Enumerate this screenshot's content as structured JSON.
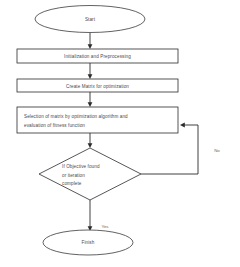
{
  "diagram": {
    "background_color": "#ffffff",
    "line_color": "#2b2b2b",
    "text_color": "#4a4a4a",
    "nodes": {
      "start": {
        "label": "Start",
        "shape": "ellipse"
      },
      "initialization": {
        "label": "Initialization and Preprocessing",
        "shape": "process"
      },
      "create_matrix": {
        "label": "Create Matrix for optimization",
        "shape": "process"
      },
      "selection": {
        "line1": "Selection of matrix by optimization algorithm and",
        "line2": "evaluation of fitness function",
        "shape": "process"
      },
      "decision": {
        "line1": "If Objective found",
        "line2": "or iteration",
        "line3": "complete",
        "shape": "diamond"
      },
      "finish": {
        "label": "Finish",
        "shape": "ellipse"
      }
    },
    "edge_labels": {
      "no": "No",
      "yes": "Yes"
    }
  }
}
